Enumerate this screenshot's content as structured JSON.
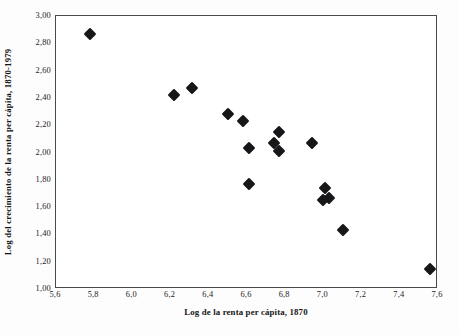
{
  "chart_data": {
    "type": "scatter",
    "title": "",
    "xlabel": "Log de la renta per cápita, 1870",
    "ylabel": "Log del crecimiento de la renta per cápita, 1870-1979",
    "xlim": [
      5.6,
      7.6
    ],
    "ylim": [
      1.0,
      3.0
    ],
    "xticks": [
      "5,6",
      "5,8",
      "6,0",
      "6,2",
      "6,4",
      "6,6",
      "6,8",
      "7,0",
      "7,2",
      "7,4",
      "7,6"
    ],
    "xtick_values": [
      5.6,
      5.8,
      6.0,
      6.2,
      6.4,
      6.6,
      6.8,
      7.0,
      7.2,
      7.4,
      7.6
    ],
    "yticks": [
      "1,00",
      "1,20",
      "1,40",
      "1,60",
      "1,80",
      "2,00",
      "2,20",
      "2,40",
      "2,60",
      "2,80",
      "3,00"
    ],
    "ytick_values": [
      1.0,
      1.2,
      1.4,
      1.6,
      1.8,
      2.0,
      2.2,
      2.4,
      2.6,
      2.8,
      3.0
    ],
    "grid": false,
    "legend": false,
    "legend_position": "none",
    "marker_shape": "diamond",
    "marker_color": "#17171a",
    "frame_color": "#4a4a4a",
    "background": "#ffffff",
    "points": [
      {
        "x": 5.78,
        "y": 2.87
      },
      {
        "x": 6.22,
        "y": 2.42
      },
      {
        "x": 6.31,
        "y": 2.47
      },
      {
        "x": 6.5,
        "y": 2.28
      },
      {
        "x": 6.58,
        "y": 2.23
      },
      {
        "x": 6.61,
        "y": 2.03
      },
      {
        "x": 6.61,
        "y": 1.77
      },
      {
        "x": 6.74,
        "y": 2.07
      },
      {
        "x": 6.77,
        "y": 2.15
      },
      {
        "x": 6.77,
        "y": 2.01
      },
      {
        "x": 6.94,
        "y": 2.07
      },
      {
        "x": 7.01,
        "y": 1.74
      },
      {
        "x": 7.0,
        "y": 1.65
      },
      {
        "x": 7.03,
        "y": 1.67
      },
      {
        "x": 7.1,
        "y": 1.43
      },
      {
        "x": 7.56,
        "y": 1.15
      }
    ]
  }
}
